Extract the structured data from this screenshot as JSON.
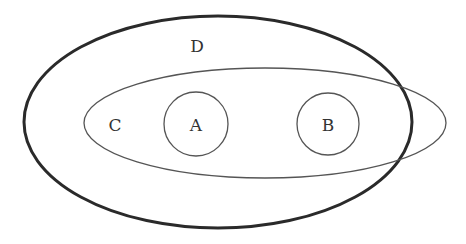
{
  "diagram": {
    "type": "venn-euler",
    "colors": {
      "stroke": "#2a2a2a",
      "thin_stroke": "#555555",
      "text": "#333333",
      "background": "#ffffff"
    },
    "sets": {
      "D": {
        "label": "D",
        "shape": "ellipse",
        "cx": 218,
        "cy": 122,
        "rx": 194,
        "ry": 106,
        "stroke_width": 3
      },
      "C": {
        "label": "C",
        "shape": "ellipse",
        "cx": 265,
        "cy": 123,
        "rx": 181,
        "ry": 55,
        "stroke_width": 1.3
      },
      "A": {
        "label": "A",
        "shape": "circle",
        "cx": 196,
        "cy": 124,
        "r": 32,
        "stroke_width": 1.3
      },
      "B": {
        "label": "B",
        "shape": "circle",
        "cx": 328,
        "cy": 124,
        "r": 31,
        "stroke_width": 1.3
      }
    },
    "label_positions": {
      "D": {
        "x": 197,
        "y": 52
      },
      "C": {
        "x": 115,
        "y": 131
      },
      "A": {
        "x": 196,
        "y": 131
      },
      "B": {
        "x": 328,
        "y": 131
      }
    },
    "relations": [
      "A is a subset of C",
      "B is a subset of C",
      "A and B are disjoint",
      "C partially overlaps D (C extends beyond D on the right)",
      "A and B lie inside D"
    ]
  }
}
